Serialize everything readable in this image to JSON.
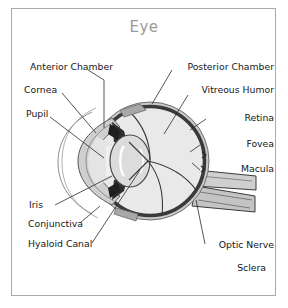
{
  "figure": {
    "title": "Eye",
    "title_color": "#9a9a9a",
    "frame_color": "#a9a9a9",
    "background": "#ffffff",
    "label_color": "#16161a"
  },
  "labels": {
    "anterior_chamber": "Anterior Chamber",
    "cornea": "Cornea",
    "pupil": "Pupil",
    "iris": "Iris",
    "conjunctiva": "Conjunctiva",
    "hyaloid_canal": "Hyaloid Canal",
    "posterior_chamber": "Posterior Chamber",
    "vitreous_humor": "Vitreous Humor",
    "retina": "Retina",
    "fovea": "Fovea",
    "macula": "Macula",
    "optic_nerve": "Optic Nerve",
    "sclera": "Sclera"
  },
  "palette": {
    "vitreous_fill": "#e9e9e9",
    "sclera_fill": "#c9c9c9",
    "retina_line": "#3a3a3a",
    "lens_fill": "#dcdcdc",
    "iris_dark": "#2f2f2f",
    "cornea_fill": "#cfcfcf",
    "nerve_fill": "#c4c4c4",
    "leader_line": "#2b2b2b"
  }
}
